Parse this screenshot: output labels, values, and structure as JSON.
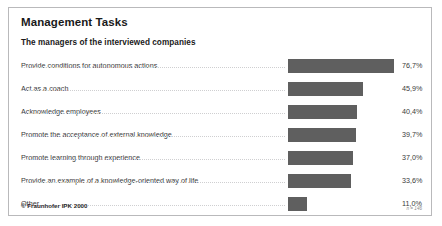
{
  "slide": {
    "title": "Management Tasks",
    "subtitle": "The managers of the interviewed companies",
    "copyright": "© Fraunhofer IPK 2000",
    "sample_note": "n = 146"
  },
  "colors": {
    "bar_fill": "#5f5f5f",
    "border": "#b9b9bb",
    "leader": "#cfcfd1",
    "text": "#3a3a3a"
  },
  "chart_data": {
    "type": "bar",
    "orientation": "horizontal",
    "title": "Management Tasks",
    "subtitle": "The managers of the interviewed companies",
    "xlabel": "",
    "ylabel": "",
    "grid": false,
    "legend": false,
    "value_suffix": "%",
    "decimal_separator": ",",
    "categories": [
      "Provide conditions for autonomous actions",
      "Act as a coach",
      "Acknowledge employees",
      "Promote the acceptance of external knowledge",
      "Promote learning through experience",
      "Provide an example of a knowledge-oriented way of life",
      "Other"
    ],
    "values": [
      76.7,
      45.9,
      40.4,
      39.7,
      37.0,
      33.6,
      11.0
    ],
    "value_labels": [
      "76,7%",
      "45,9%",
      "40,4%",
      "39,7%",
      "37,0%",
      "33,6%",
      "11,0%"
    ],
    "bar_pixel_widths": [
      106,
      75,
      69,
      68,
      65,
      63,
      19
    ],
    "annotation": "n = 146"
  }
}
